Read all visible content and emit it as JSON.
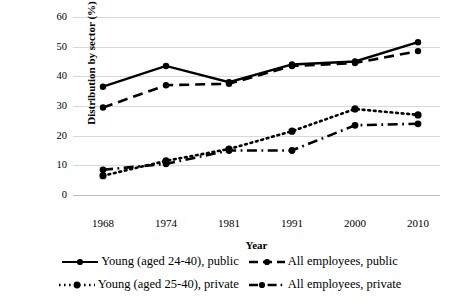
{
  "chart_data": {
    "type": "line",
    "title": "",
    "xlabel": "Year",
    "ylabel": "Distribution by sector (%)",
    "categories": [
      "1968",
      "1974",
      "1981",
      "1991",
      "2000",
      "2010"
    ],
    "ylim": [
      0,
      60
    ],
    "ytick_labels": [
      "0",
      "10",
      "20",
      "30",
      "40",
      "50",
      "60"
    ],
    "ytick_values": [
      0,
      10,
      20,
      30,
      40,
      50,
      60
    ],
    "grid": "horizontal",
    "legend_position": "bottom",
    "series": [
      {
        "name": "Young (aged 24-40), public",
        "style": "solid",
        "color": "#000000",
        "marker": "circle",
        "values": [
          36.5,
          43.5,
          38.0,
          44.0,
          45.0,
          51.5
        ]
      },
      {
        "name": "All employees, public",
        "style": "dashed",
        "color": "#000000",
        "marker": "circle",
        "values": [
          29.5,
          37.0,
          37.5,
          43.5,
          44.5,
          48.5
        ]
      },
      {
        "name": "Young (aged 25-40), private",
        "style": "dotted",
        "color": "#000000",
        "marker": "circle",
        "values": [
          6.5,
          11.5,
          15.5,
          21.5,
          29.0,
          27.0
        ]
      },
      {
        "name": "All employees, private",
        "style": "dashdot",
        "color": "#000000",
        "marker": "circle",
        "values": [
          8.5,
          10.5,
          15.0,
          15.0,
          23.5,
          24.0
        ]
      }
    ]
  },
  "legend": {
    "items": [
      {
        "label": "Young (aged 24-40), public",
        "style": "solid"
      },
      {
        "label": "All employees, public",
        "style": "dashed"
      },
      {
        "label": "Young (aged 25-40), private",
        "style": "dotted"
      },
      {
        "label": "All employees, private",
        "style": "dashdot"
      }
    ]
  }
}
